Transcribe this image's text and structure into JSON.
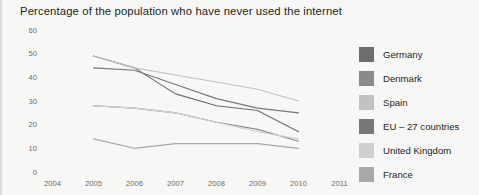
{
  "chart_data": {
    "type": "line",
    "title": "Percentage of the population who have never used the internet",
    "xlabel": "",
    "ylabel": "",
    "xlim": [
      2004,
      2011
    ],
    "ylim": [
      0,
      60
    ],
    "grid": false,
    "legend_position": "right",
    "x": [
      2005,
      2006,
      2007,
      2008,
      2009,
      2010
    ],
    "xticks": [
      "2004",
      "2005",
      "2006",
      "2007",
      "2008",
      "2009",
      "2010",
      "2011"
    ],
    "yticks": [
      "0",
      "10",
      "20",
      "30",
      "40",
      "50",
      "60"
    ],
    "series": [
      {
        "name": "Germany",
        "color": "#6d6d6d",
        "values": [
          49,
          44,
          33,
          28,
          26,
          17
        ]
      },
      {
        "name": "Denmark",
        "color": "#8a8a8a",
        "values": [
          28,
          27,
          25,
          21,
          18,
          13
        ]
      },
      {
        "name": "Spain",
        "color": "#c2c2c2",
        "values": [
          49,
          44,
          41,
          38,
          35,
          30
        ]
      },
      {
        "name": "EU – 27 countries",
        "color": "#777777",
        "values": [
          44,
          43,
          37,
          31,
          27,
          25
        ]
      },
      {
        "name": "United Kingdom",
        "color": "#cfcfcf",
        "values": [
          28,
          27,
          25,
          21,
          17,
          14
        ]
      },
      {
        "name": "France",
        "color": "#a8a8a8",
        "values": [
          14,
          10,
          12,
          12,
          12,
          10
        ]
      }
    ]
  },
  "legend": {
    "items": [
      {
        "label": "Germany",
        "swatch": "#6d6d6d"
      },
      {
        "label": "Denmark",
        "swatch": "#8a8a8a"
      },
      {
        "label": "Spain",
        "swatch": "#c2c2c2"
      },
      {
        "label": "EU – 27 countries",
        "swatch": "#777777"
      },
      {
        "label": "United Kingdom",
        "swatch": "#cfcfcf"
      },
      {
        "label": "France",
        "swatch": "#a8a8a8"
      }
    ]
  }
}
